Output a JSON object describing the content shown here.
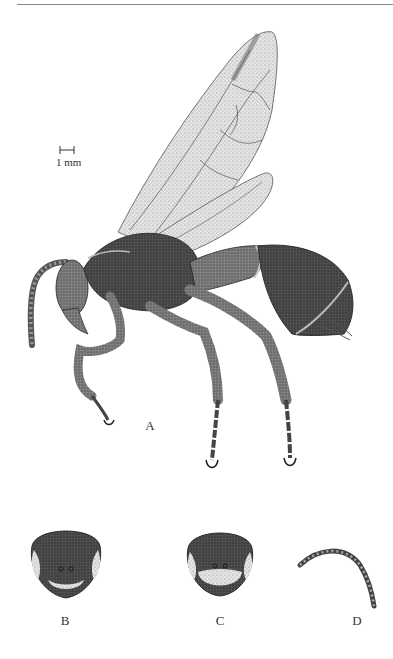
{
  "page": {
    "running_head": "· · · · · · ·",
    "colors": {
      "ink": "#2a2a2a",
      "dark_body": "#3a3a3a",
      "mid_body": "#6a6a6a",
      "wing_fill": "#d9d9d9",
      "wing_vein": "#555555",
      "background": "#ffffff"
    }
  },
  "figure": {
    "scale_bar": {
      "label": "1 mm",
      "x": 60,
      "y": 147,
      "length_px": 14
    },
    "panels": [
      {
        "id": "A",
        "label": "A",
        "description": "Habitus, lateral view",
        "label_x": 150,
        "label_y": 424
      },
      {
        "id": "B",
        "label": "B",
        "description": "Head, frontal view",
        "label_x": 65,
        "label_y": 620
      },
      {
        "id": "C",
        "label": "C",
        "description": "Head, frontal view (variant)",
        "label_x": 220,
        "label_y": 620
      },
      {
        "id": "D",
        "label": "D",
        "description": "Antenna",
        "label_x": 357,
        "label_y": 620
      }
    ]
  }
}
